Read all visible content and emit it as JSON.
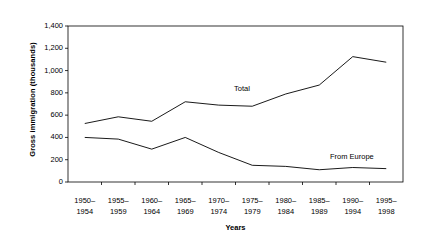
{
  "chart_data": {
    "type": "line",
    "title": "",
    "xlabel": "Years",
    "ylabel": "Gross immigration (thousands)",
    "categories": [
      "1950–1954",
      "1955–1959",
      "1960–1964",
      "1965–1969",
      "1970–1974",
      "1975–1979",
      "1980–1984",
      "1985–1989",
      "1990–1994",
      "1995–1998"
    ],
    "categories_lines": [
      {
        "line1": "1950–",
        "line2": "1954"
      },
      {
        "line1": "1955–",
        "line2": "1959"
      },
      {
        "line1": "1960–",
        "line2": "1964"
      },
      {
        "line1": "1965–",
        "line2": "1969"
      },
      {
        "line1": "1970–",
        "line2": "1974"
      },
      {
        "line1": "1975–",
        "line2": "1979"
      },
      {
        "line1": "1980–",
        "line2": "1984"
      },
      {
        "line1": "1985–",
        "line2": "1989"
      },
      {
        "line1": "1990–",
        "line2": "1994"
      },
      {
        "line1": "1995–",
        "line2": "1998"
      }
    ],
    "series": [
      {
        "name": "Total",
        "values": [
          525,
          585,
          545,
          720,
          690,
          680,
          790,
          870,
          1125,
          1075
        ],
        "color": "#000000"
      },
      {
        "name": "From Europe",
        "values": [
          400,
          385,
          295,
          400,
          265,
          150,
          140,
          110,
          130,
          120
        ],
        "color": "#000000"
      }
    ],
    "ylim": [
      0,
      1400
    ],
    "yticks": [
      0,
      200,
      400,
      600,
      800,
      1000,
      1200,
      1400
    ],
    "ytick_labels": [
      "0",
      "200",
      "400",
      "600",
      "800",
      "1,000",
      "1,200",
      "1,400"
    ],
    "grid": false,
    "legend_position": "inline-annotations",
    "annotations": [
      {
        "text": "Total",
        "series": "Total"
      },
      {
        "text": "From Europe",
        "series": "From Europe"
      }
    ],
    "plot_border": true,
    "background_color": "#ffffff",
    "axis_color": "#000000"
  }
}
